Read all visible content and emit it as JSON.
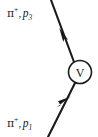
{
  "diagram": {
    "type": "feynman-vertex-diagram",
    "background_color": "#ffffff",
    "stroke_color": "#1a1a1a",
    "width": 98,
    "height": 137,
    "vertex": {
      "label": "V",
      "center_x": 80,
      "center_y": 72,
      "radius": 11.5
    },
    "lines": [
      {
        "name": "outgoing-pion-line",
        "from_x": 74,
        "from_y": 62,
        "to_x": 51,
        "to_y": 0,
        "arrow_direction": "up-left",
        "arrow_x": 61,
        "arrow_y": 30
      },
      {
        "name": "incoming-pion-line",
        "from_x": 48,
        "from_y": 137,
        "to_x": 75,
        "to_y": 82,
        "arrow_direction": "up-right",
        "arrow_x": 67,
        "arrow_y": 99
      }
    ],
    "labels": {
      "outgoing": {
        "particle": "π",
        "charge": "+",
        "comma": ",",
        "momentum": "p",
        "index": "3",
        "full_text": "π⁺, p₃"
      },
      "incoming": {
        "particle": "π",
        "charge": "+",
        "comma": ",",
        "momentum": "p",
        "index": "1",
        "full_text": "π⁺, p₁"
      }
    }
  }
}
